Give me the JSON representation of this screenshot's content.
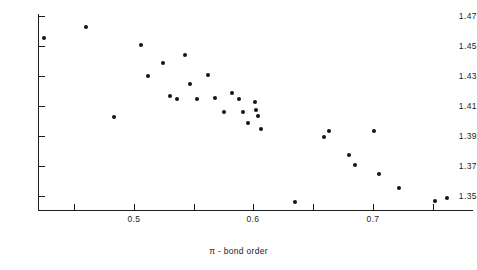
{
  "chart_data": {
    "type": "scatter",
    "title": "",
    "xlabel": "π - bond order",
    "ylabel": "",
    "xlim": [
      0.41,
      0.775
    ],
    "ylim": [
      1.34,
      1.477
    ],
    "grid": false,
    "legend": null,
    "x_ticks": [
      {
        "value": 0.45,
        "label": ""
      },
      {
        "value": 0.5,
        "label": "0.5"
      },
      {
        "value": 0.55,
        "label": ""
      },
      {
        "value": 0.6,
        "label": "0.6"
      },
      {
        "value": 0.65,
        "label": ""
      },
      {
        "value": 0.7,
        "label": "0.7"
      },
      {
        "value": 0.75,
        "label": ""
      }
    ],
    "y_ticks": [
      {
        "value": 1.47,
        "label": "1.47"
      },
      {
        "value": 1.45,
        "label": "1.45"
      },
      {
        "value": 1.43,
        "label": "1.43"
      },
      {
        "value": 1.41,
        "label": "1.41"
      },
      {
        "value": 1.39,
        "label": "1.39"
      },
      {
        "value": 1.37,
        "label": "1.37"
      },
      {
        "value": 1.35,
        "label": "1.35"
      }
    ],
    "marker_color": "#141414",
    "points": [
      {
        "x": 0.425,
        "y": 1.4555
      },
      {
        "x": 0.46,
        "y": 1.4625
      },
      {
        "x": 0.483,
        "y": 1.4025
      },
      {
        "x": 0.506,
        "y": 1.451
      },
      {
        "x": 0.512,
        "y": 1.43
      },
      {
        "x": 0.524,
        "y": 1.4385
      },
      {
        "x": 0.53,
        "y": 1.417
      },
      {
        "x": 0.536,
        "y": 1.4145
      },
      {
        "x": 0.543,
        "y": 1.444
      },
      {
        "x": 0.547,
        "y": 1.425
      },
      {
        "x": 0.553,
        "y": 1.4145
      },
      {
        "x": 0.562,
        "y": 1.431
      },
      {
        "x": 0.568,
        "y": 1.4155
      },
      {
        "x": 0.575,
        "y": 1.406
      },
      {
        "x": 0.582,
        "y": 1.419
      },
      {
        "x": 0.588,
        "y": 1.415
      },
      {
        "x": 0.591,
        "y": 1.406
      },
      {
        "x": 0.595,
        "y": 1.399
      },
      {
        "x": 0.601,
        "y": 1.4125
      },
      {
        "x": 0.602,
        "y": 1.4075
      },
      {
        "x": 0.604,
        "y": 1.4035
      },
      {
        "x": 0.606,
        "y": 1.3945
      },
      {
        "x": 0.635,
        "y": 1.346
      },
      {
        "x": 0.659,
        "y": 1.3895
      },
      {
        "x": 0.663,
        "y": 1.3935
      },
      {
        "x": 0.68,
        "y": 1.3775
      },
      {
        "x": 0.685,
        "y": 1.3705
      },
      {
        "x": 0.701,
        "y": 1.3935
      },
      {
        "x": 0.705,
        "y": 1.3645
      },
      {
        "x": 0.722,
        "y": 1.3555
      },
      {
        "x": 0.752,
        "y": 1.347
      },
      {
        "x": 0.762,
        "y": 1.3485
      }
    ]
  }
}
